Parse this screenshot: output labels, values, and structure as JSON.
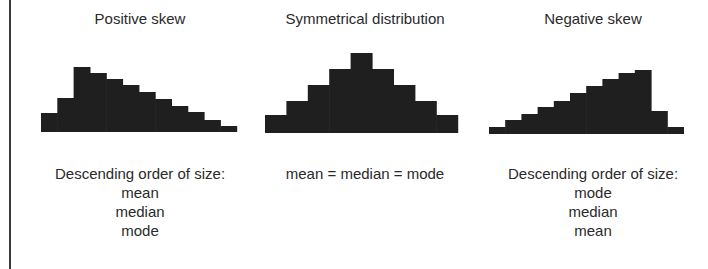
{
  "panels": [
    {
      "title": "Positive skew",
      "caption_lines": [
        "Descending order of size:",
        "mean",
        "median",
        "mode"
      ]
    },
    {
      "title": "Symmetrical distribution",
      "caption_lines": [
        "mean = median = mode"
      ]
    },
    {
      "title": "Negative skew",
      "caption_lines": [
        "Descending order of size:",
        "mode",
        "median",
        "mean"
      ]
    }
  ],
  "colors": {
    "bar": "#1f1f1f",
    "text": "#2a2a2a",
    "rule": "#3a3a3a"
  },
  "chart_data": [
    {
      "type": "bar",
      "title": "Positive skew",
      "categories": [
        "1",
        "2",
        "3",
        "4",
        "5",
        "6",
        "7",
        "8",
        "9",
        "10",
        "11",
        "12"
      ],
      "values": [
        19,
        34,
        65,
        59,
        53,
        47,
        40,
        33,
        26,
        20,
        12,
        6
      ],
      "xlabel": "",
      "ylabel": "",
      "grid": false
    },
    {
      "type": "bar",
      "title": "Symmetrical distribution",
      "categories": [
        "1",
        "2",
        "3",
        "4",
        "5",
        "6",
        "7",
        "8",
        "9"
      ],
      "values": [
        18,
        32,
        48,
        64,
        80,
        64,
        48,
        32,
        18
      ],
      "xlabel": "",
      "ylabel": "",
      "grid": false
    },
    {
      "type": "bar",
      "title": "Negative skew",
      "categories": [
        "1",
        "2",
        "3",
        "4",
        "5",
        "6",
        "7",
        "8",
        "9",
        "10",
        "11",
        "12"
      ],
      "values": [
        7,
        14,
        20,
        27,
        33,
        41,
        48,
        55,
        61,
        64,
        23,
        7
      ],
      "xlabel": "",
      "ylabel": "",
      "grid": false
    }
  ]
}
